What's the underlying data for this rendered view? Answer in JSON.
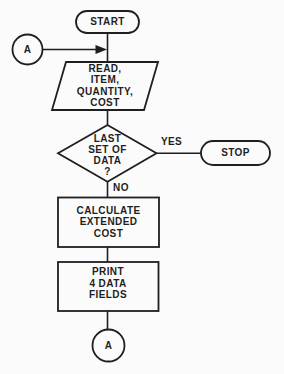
{
  "diagram": {
    "type": "flowchart",
    "nodes": {
      "start": {
        "shape": "terminator",
        "label": "START"
      },
      "connector_a_top": {
        "shape": "circle-connector",
        "label": "A"
      },
      "read_input": {
        "shape": "parallelogram-io",
        "lines": [
          "READ,",
          "ITEM,",
          "QUANTITY,",
          "COST"
        ]
      },
      "last_set_decision": {
        "shape": "diamond-decision",
        "lines": [
          "LAST",
          "SET OF",
          "DATA",
          "?"
        ]
      },
      "stop": {
        "shape": "terminator",
        "label": "STOP"
      },
      "calculate": {
        "shape": "process-rectangle",
        "lines": [
          "CALCULATE",
          "EXTENDED",
          "COST"
        ]
      },
      "print": {
        "shape": "process-rectangle",
        "lines": [
          "PRINT",
          "4 DATA",
          "FIELDS"
        ]
      },
      "connector_a_bottom": {
        "shape": "circle-connector",
        "label": "A"
      }
    },
    "edges": {
      "yes_branch_label": "YES",
      "no_branch_label": "NO"
    }
  },
  "colors": {
    "ink": "#1f1f1f",
    "paper": "#fbfbfb"
  }
}
